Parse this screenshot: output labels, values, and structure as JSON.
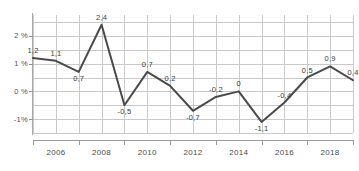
{
  "chart_data": {
    "type": "line",
    "title": "",
    "xlabel": "",
    "ylabel": "",
    "ylim": [
      -1.5,
      2.75
    ],
    "xlim": [
      2005,
      2019
    ],
    "grid": true,
    "legend": null,
    "y_tick_labels": [
      "2 %",
      "1 %",
      "0 %",
      "-1%"
    ],
    "y_tick_values": [
      2,
      1,
      0,
      -1
    ],
    "x_tick_labels": [
      "2006",
      "2008",
      "2010",
      "2012",
      "2014",
      "2016",
      "2018"
    ],
    "x_tick_values": [
      2006,
      2008,
      2010,
      2012,
      2014,
      2016,
      2018
    ],
    "x": [
      2005,
      2006,
      2007,
      2008,
      2009,
      2010,
      2011,
      2012,
      2013,
      2014,
      2015,
      2016,
      2017,
      2018,
      2019
    ],
    "values": [
      1.2,
      1.1,
      0.7,
      2.4,
      -0.5,
      0.7,
      0.2,
      -0.7,
      -0.2,
      0.0,
      -1.1,
      -0.4,
      0.5,
      0.9,
      0.4
    ],
    "point_labels": [
      "1,2",
      "1,1",
      "0,7",
      "2,4",
      "-0,5",
      "0,7",
      "0,2",
      "-0,7",
      "-0,2",
      "0",
      "-1,1",
      "-0,4",
      "0,5",
      "0,9",
      "0,4"
    ],
    "label_positions": [
      "above",
      "above",
      "below",
      "above",
      "below",
      "above",
      "above",
      "below",
      "above",
      "above",
      "below",
      "above",
      "above",
      "above",
      "above"
    ],
    "series_color": "#4a4a4a",
    "grid_color": "#c9c9c9",
    "axis_color": "#9a9a9a",
    "label_color": "#3c3c3c"
  },
  "clipped_header_text": ""
}
